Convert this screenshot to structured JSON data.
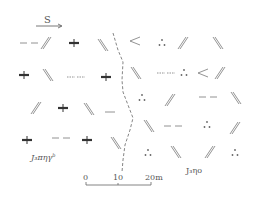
{
  "diagram": {
    "type": "geological-outcrop-sketch",
    "colors": {
      "ink": "#444444",
      "light_ink": "#888888",
      "background": "#ffffff"
    },
    "direction_indicator": {
      "label": "S",
      "arrow": "right"
    },
    "units": [
      {
        "id": "left",
        "label": "J₃πηγ",
        "superscript": "b"
      },
      {
        "id": "right",
        "label": "J₃ηo",
        "superscript": ""
      }
    ],
    "boundary": {
      "style": "dashed",
      "points": [
        [
          113,
          33
        ],
        [
          118,
          50
        ],
        [
          123,
          62
        ],
        [
          122,
          80
        ],
        [
          123,
          92
        ],
        [
          128,
          105
        ],
        [
          133,
          118
        ],
        [
          130,
          130
        ],
        [
          125,
          145
        ],
        [
          123,
          160
        ],
        [
          122,
          172
        ]
      ]
    },
    "scale_bar": {
      "ticks": [
        "0",
        "10",
        "20m"
      ]
    },
    "symbols": [
      {
        "kind": "dash-pair",
        "x": 29,
        "y": 43
      },
      {
        "kind": "double-slash",
        "x": 46,
        "y": 43
      },
      {
        "kind": "bold-cross",
        "x": 74,
        "y": 43
      },
      {
        "kind": "double-backslash",
        "x": 103,
        "y": 45
      },
      {
        "kind": "angle",
        "x": 135,
        "y": 41
      },
      {
        "kind": "three-dots",
        "x": 162,
        "y": 43
      },
      {
        "kind": "double-slash",
        "x": 183,
        "y": 43
      },
      {
        "kind": "double-backslash",
        "x": 218,
        "y": 43
      },
      {
        "kind": "bold-cross",
        "x": 24,
        "y": 75
      },
      {
        "kind": "double-backslash",
        "x": 48,
        "y": 75
      },
      {
        "kind": "dot-dash",
        "x": 76,
        "y": 77
      },
      {
        "kind": "bold-cross",
        "x": 106,
        "y": 77
      },
      {
        "kind": "double-backslash",
        "x": 136,
        "y": 73
      },
      {
        "kind": "dot-dash",
        "x": 166,
        "y": 73
      },
      {
        "kind": "three-dots",
        "x": 184,
        "y": 73
      },
      {
        "kind": "angle",
        "x": 203,
        "y": 73
      },
      {
        "kind": "double-slash",
        "x": 220,
        "y": 73
      },
      {
        "kind": "double-slash",
        "x": 36,
        "y": 108
      },
      {
        "kind": "bold-cross",
        "x": 63,
        "y": 108
      },
      {
        "kind": "double-backslash",
        "x": 89,
        "y": 109
      },
      {
        "kind": "single-dash",
        "x": 110,
        "y": 112
      },
      {
        "kind": "three-dots",
        "x": 142,
        "y": 98
      },
      {
        "kind": "double-slash",
        "x": 170,
        "y": 100
      },
      {
        "kind": "dash-pair",
        "x": 208,
        "y": 97
      },
      {
        "kind": "double-backslash",
        "x": 236,
        "y": 98
      },
      {
        "kind": "bold-cross",
        "x": 27,
        "y": 140
      },
      {
        "kind": "dash-pair",
        "x": 61,
        "y": 138
      },
      {
        "kind": "bold-cross",
        "x": 87,
        "y": 140
      },
      {
        "kind": "double-backslash",
        "x": 116,
        "y": 143
      },
      {
        "kind": "double-backslash",
        "x": 149,
        "y": 126
      },
      {
        "kind": "dash-pair",
        "x": 173,
        "y": 126
      },
      {
        "kind": "three-dots",
        "x": 207,
        "y": 125
      },
      {
        "kind": "double-slash",
        "x": 235,
        "y": 128
      },
      {
        "kind": "three-dots",
        "x": 148,
        "y": 153
      },
      {
        "kind": "double-backslash",
        "x": 176,
        "y": 152
      },
      {
        "kind": "double-slash",
        "x": 210,
        "y": 152
      },
      {
        "kind": "three-dots",
        "x": 235,
        "y": 153
      }
    ]
  }
}
